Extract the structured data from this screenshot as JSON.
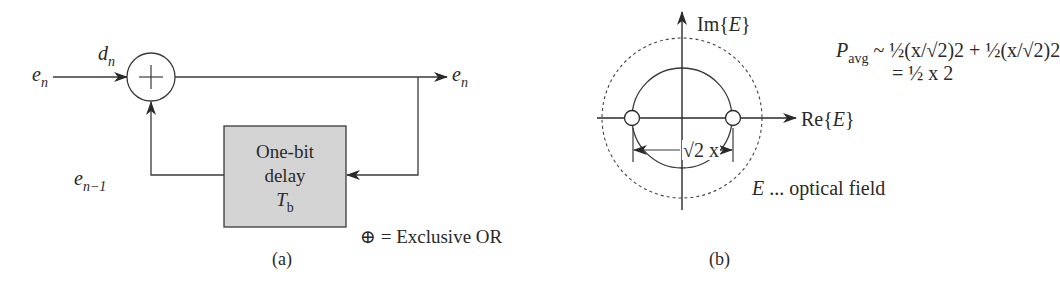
{
  "panel_a": {
    "input_label": {
      "base": "e",
      "sub": "n"
    },
    "input_bit_label": {
      "base": "d",
      "sub": "n"
    },
    "output_label": {
      "base": "e",
      "sub": "n"
    },
    "feedback_label": {
      "base": "e",
      "sub": "n−1"
    },
    "xor_symbol": "+",
    "delay_box": {
      "line1": "One-bit",
      "line2": "delay",
      "line3_base": "T",
      "line3_sub": "b",
      "fill": "#d4d4d4"
    },
    "legend": "⊕ = Exclusive OR",
    "caption": "(a)"
  },
  "panel_b": {
    "y_axis_label": {
      "prefix": "Im{",
      "var": "E",
      "suffix": "}"
    },
    "x_axis_label": {
      "prefix": "Re{",
      "var": "E",
      "suffix": "}"
    },
    "distance_label": "√2 x",
    "formula_line1_lhs_base": "P",
    "formula_line1_lhs_sub": "avg",
    "formula_line1_rhs": "~ ½(x/√2)2 + ½(x/√2)2",
    "formula_line2": "= ½ x 2",
    "field_note_var": "E",
    "field_note_text": " ... optical field",
    "caption": "(b)"
  }
}
